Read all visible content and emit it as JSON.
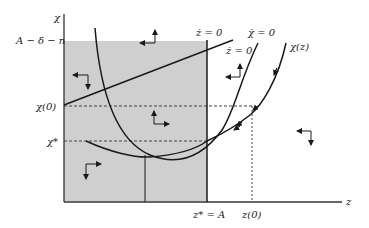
{
  "diagram": {
    "type": "phase-diagram",
    "axes": {
      "y_label": "χ",
      "x_label": "z"
    },
    "y_ticks": {
      "upper_bound": "A − δ − n",
      "initial": "χ(0)",
      "steady_state": "χ*"
    },
    "x_ticks": {
      "steady_state": "z* = A",
      "initial": "z(0)"
    },
    "curves": {
      "z_dot_zero_vertical": "ż = 0",
      "z_dot_zero_upward": "ż = 0",
      "chi_dot_zero": "χ̇ = 0",
      "saddle_path": "χ(z)"
    },
    "colors": {
      "shaded_region": "#cfcfcf",
      "lines": "#1a1a1a"
    }
  }
}
